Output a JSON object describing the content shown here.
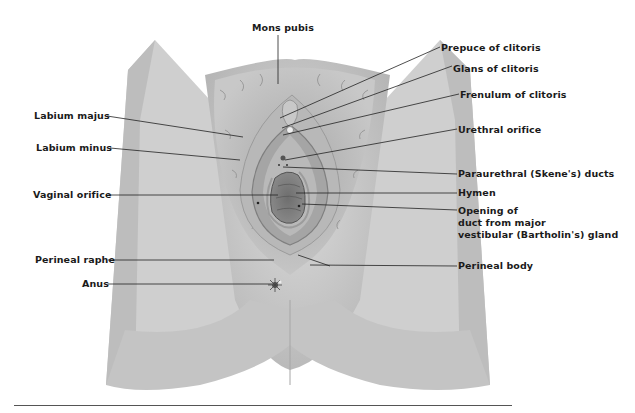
{
  "figure": {
    "colors": {
      "skin_light": "#d8d8d8",
      "skin_mid": "#bdbdbd",
      "skin_dark": "#9a9a9a",
      "hair": "#8c8c8c",
      "leader_line": "#222222",
      "label_text": "#1a1a1a"
    }
  },
  "labels": {
    "mons_pubis": "Mons pubis",
    "prepuce_of_clitoris": "Prepuce of clitoris",
    "glans_of_clitoris": "Glans of clitoris",
    "frenulum_of_clitoris": "Frenulum of clitoris",
    "urethral_orifice": "Urethral orifice",
    "paraurethral_ducts": "Paraurethral (Skene's) ducts",
    "hymen": "Hymen",
    "bartholin_opening": "Opening of\nduct from major\nvestibular (Bartholin's) gland",
    "perineal_body": "Perineal body",
    "labium_majus": "Labium majus",
    "labium_minus": "Labium minus",
    "vaginal_orifice": "Vaginal orifice",
    "perineal_raphe": "Perineal raphe",
    "anus": "Anus"
  }
}
